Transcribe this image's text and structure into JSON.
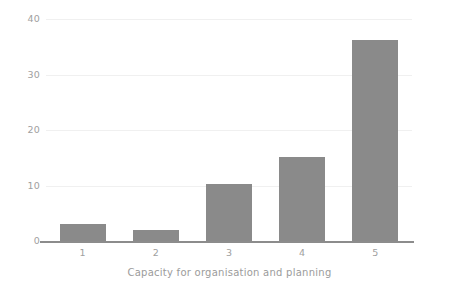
{
  "chart_data": {
    "type": "bar",
    "title": "",
    "subtitle": "",
    "xlabel": "Capacity for organisation and planning",
    "ylabel": "",
    "categories": [
      "1",
      "2",
      "3",
      "4",
      "5"
    ],
    "values": [
      3,
      2,
      10.3,
      15.2,
      36.2
    ],
    "ylim": [
      0,
      40
    ],
    "yticks": [
      0,
      10,
      20,
      30,
      40
    ],
    "ytick_labels": [
      "0",
      "10",
      "20",
      "30",
      "40"
    ],
    "xtick_labels": [
      "1",
      "2",
      "3",
      "4",
      "5"
    ],
    "grid": true,
    "grid_axis": "y",
    "legend": null,
    "legend_position": "none",
    "bar_color": "#8a8a8a",
    "grid_color": "#f0f0f0",
    "axis_color": "#8c8c8c",
    "tick_label_color": "#a0a0a0",
    "axis_label_color": "#9b9b9b",
    "background_color": "#ffffff"
  }
}
